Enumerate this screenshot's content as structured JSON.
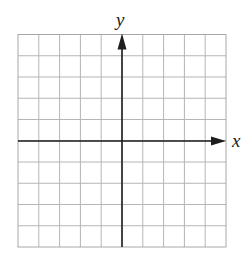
{
  "chart_data": {
    "type": "coordinate-grid",
    "title": "",
    "xlabel": "x",
    "ylabel": "y",
    "grid": true,
    "grid_columns": 10,
    "grid_rows": 10,
    "x_range": [
      -5,
      5
    ],
    "y_range": [
      -5,
      5
    ],
    "x_tick_labels": [],
    "y_tick_labels": [],
    "series": [],
    "axes": {
      "x_axis_arrow": "positive-direction",
      "y_axis_arrow": "positive-direction"
    }
  },
  "figure": {
    "labels": {
      "x": "x",
      "y": "y"
    },
    "colors": {
      "grid_line": "#b5b5b5",
      "grid_border": "#a8a8a8",
      "axis": "#1e1e1e",
      "label": "#222222",
      "background": "#ffffff"
    },
    "geometry": {
      "left": 18,
      "top": 34.5,
      "right": 226,
      "bottom": 247,
      "x_axis_y": 141,
      "y_axis_x": 122
    }
  }
}
